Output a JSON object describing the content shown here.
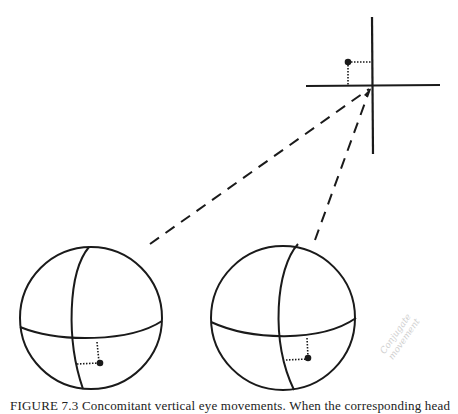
{
  "figure": {
    "caption_visible": "FIGURE 7.3    Concomitant vertical eye movements. When the corresponding head",
    "handwritten_annotation": [
      "Conjugate",
      "movement"
    ],
    "elements": {
      "crosshair": {
        "cx": 372,
        "cy": 86,
        "v_top": 17,
        "v_bottom": 154,
        "h_left": 306,
        "h_right": 440,
        "target_dot": {
          "x": 348,
          "y": 62
        }
      },
      "left_eye": {
        "cx": 91,
        "cy": 318,
        "r": 71,
        "pupil_dot": {
          "x": 99,
          "y": 362
        }
      },
      "right_eye": {
        "cx": 283,
        "cy": 318,
        "r": 72,
        "pupil_dot": {
          "x": 309,
          "y": 358
        }
      },
      "sightlines": [
        {
          "from": [
            150,
            244
          ],
          "to": [
            369,
            89
          ]
        },
        {
          "from": [
            315,
            240
          ],
          "to": [
            370,
            89
          ]
        }
      ]
    },
    "colors": {
      "ink": "#1a1a1a",
      "paper": "#ffffff",
      "annotation": "#d0d0d0"
    }
  }
}
